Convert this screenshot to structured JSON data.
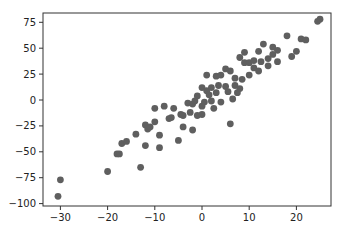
{
  "chart_data": {
    "type": "scatter",
    "title": "",
    "xlabel": "",
    "ylabel": "",
    "xlim": [
      -33.5,
      27.5
    ],
    "ylim": [
      -102,
      85
    ],
    "grid": false,
    "legend": null,
    "marker_color": "#5f5f5f",
    "xticks": [
      -30,
      -20,
      -10,
      0,
      10,
      20
    ],
    "yticks": [
      75,
      50,
      25,
      0,
      -25,
      -50,
      -75,
      -100
    ],
    "points": [
      [
        -30.5,
        -93
      ],
      [
        -30,
        -77
      ],
      [
        -20,
        -69
      ],
      [
        -18,
        -52
      ],
      [
        -17.5,
        -52
      ],
      [
        -17,
        -42
      ],
      [
        -16,
        -40
      ],
      [
        -14,
        -33
      ],
      [
        -13,
        -65
      ],
      [
        -12,
        -24
      ],
      [
        -12,
        -44
      ],
      [
        -11.5,
        -28
      ],
      [
        -11,
        -26
      ],
      [
        -10,
        -21
      ],
      [
        -10,
        -8
      ],
      [
        -9,
        -46
      ],
      [
        -9,
        -34
      ],
      [
        -8,
        -6
      ],
      [
        -7,
        -18
      ],
      [
        -6.5,
        -17
      ],
      [
        -6,
        -8
      ],
      [
        -5,
        -39
      ],
      [
        -4.5,
        -14
      ],
      [
        -4,
        -15
      ],
      [
        -4,
        -26
      ],
      [
        -3,
        -3
      ],
      [
        -2.5,
        -12
      ],
      [
        -2,
        -29
      ],
      [
        -2,
        -4
      ],
      [
        -1.5,
        -1
      ],
      [
        -1,
        -15
      ],
      [
        -1,
        4
      ],
      [
        0,
        -6
      ],
      [
        0,
        12
      ],
      [
        0,
        -14
      ],
      [
        0.5,
        -2
      ],
      [
        1,
        9
      ],
      [
        1,
        24
      ],
      [
        1.5,
        5
      ],
      [
        2,
        -1
      ],
      [
        2,
        12
      ],
      [
        2.5,
        -8
      ],
      [
        3,
        7
      ],
      [
        3,
        23
      ],
      [
        3.5,
        14
      ],
      [
        4,
        -2
      ],
      [
        4,
        24
      ],
      [
        5,
        30
      ],
      [
        5,
        13
      ],
      [
        5.5,
        8
      ],
      [
        6,
        28
      ],
      [
        6,
        -23
      ],
      [
        6.5,
        1
      ],
      [
        7,
        21
      ],
      [
        7,
        14
      ],
      [
        7.5,
        7
      ],
      [
        8,
        41
      ],
      [
        8,
        11
      ],
      [
        8.5,
        20
      ],
      [
        9,
        36
      ],
      [
        9,
        46
      ],
      [
        10,
        24
      ],
      [
        10,
        36
      ],
      [
        11,
        31
      ],
      [
        11,
        38
      ],
      [
        12,
        28
      ],
      [
        12,
        47
      ],
      [
        12.5,
        37
      ],
      [
        13,
        54
      ],
      [
        14,
        40
      ],
      [
        14,
        33
      ],
      [
        15,
        44
      ],
      [
        15,
        51
      ],
      [
        16,
        48
      ],
      [
        16,
        37
      ],
      [
        18,
        62
      ],
      [
        19,
        42
      ],
      [
        20,
        47
      ],
      [
        21,
        59
      ],
      [
        22,
        58
      ],
      [
        24.5,
        76
      ],
      [
        25,
        78
      ]
    ]
  }
}
